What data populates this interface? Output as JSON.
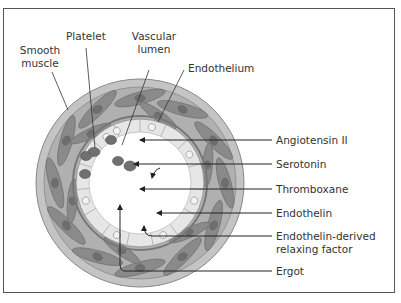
{
  "diagram": {
    "labels_top": {
      "smooth_muscle": [
        "Smooth",
        "muscle"
      ],
      "platelet": "Platelet",
      "vascular_lumen": [
        "Vascular",
        "lumen"
      ],
      "endothelium": "Endothelium"
    },
    "labels_right": [
      {
        "text": [
          "Angiotensin II"
        ]
      },
      {
        "text": [
          "Serotonin"
        ]
      },
      {
        "text": [
          "Thromboxane"
        ]
      },
      {
        "text": [
          "Endothelin"
        ]
      },
      {
        "text": [
          "Endothelin-derived",
          "relaxing factor"
        ]
      },
      {
        "text": [
          "Ergot"
        ]
      }
    ],
    "colors": {
      "outer_ring": "#c4c4c4",
      "muscle_cell": "#8a8a8a",
      "nucleus": "#6e6e6e",
      "endothelial_ring": "#e6e6e6",
      "lumen": "#ffffff",
      "line": "#222222"
    }
  }
}
